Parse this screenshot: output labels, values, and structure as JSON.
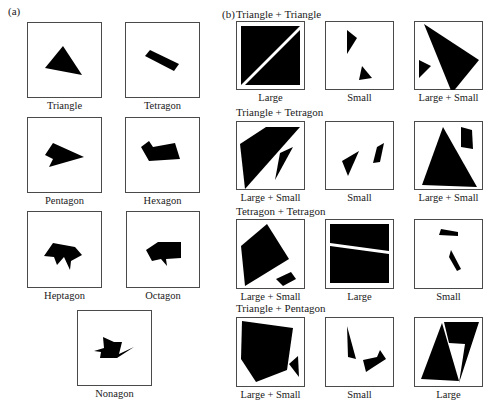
{
  "panel_a": {
    "label": "(a)",
    "items": [
      {
        "caption": "Triangle",
        "x": 27,
        "y": 22,
        "w": 75,
        "h": 76,
        "shapes": [
          [
            [
              18,
              46
            ],
            [
              36,
              24
            ],
            [
              55,
              53
            ]
          ]
        ]
      },
      {
        "caption": "Tetragon",
        "x": 125,
        "y": 22,
        "w": 75,
        "h": 76,
        "shapes": [
          [
            [
              20,
              34
            ],
            [
              25,
              28
            ],
            [
              54,
              42
            ],
            [
              49,
              49
            ]
          ]
        ]
      },
      {
        "caption": "Pentagon",
        "x": 27,
        "y": 117,
        "w": 75,
        "h": 76,
        "shapes": [
          [
            [
              18,
              38
            ],
            [
              26,
              26
            ],
            [
              57,
              40
            ],
            [
              22,
              50
            ],
            [
              26,
              42
            ]
          ]
        ]
      },
      {
        "caption": "Hexagon",
        "x": 125,
        "y": 117,
        "w": 75,
        "h": 76,
        "shapes": [
          [
            [
              16,
              30
            ],
            [
              24,
              24
            ],
            [
              28,
              30
            ],
            [
              50,
              26
            ],
            [
              55,
              42
            ],
            [
              24,
              44
            ]
          ]
        ]
      },
      {
        "caption": "Heptagon",
        "x": 27,
        "y": 211,
        "w": 75,
        "h": 77,
        "shapes": [
          [
            [
              17,
              45
            ],
            [
              26,
              32
            ],
            [
              48,
              36
            ],
            [
              55,
              44
            ],
            [
              44,
              50
            ],
            [
              43,
              59
            ],
            [
              37,
              46
            ],
            [
              30,
              54
            ],
            [
              27,
              46
            ]
          ]
        ]
      },
      {
        "caption": "Octagon",
        "x": 126,
        "y": 211,
        "w": 74,
        "h": 77,
        "shapes": [
          [
            [
              20,
              39
            ],
            [
              32,
              31
            ],
            [
              55,
              31
            ],
            [
              55,
              47
            ],
            [
              40,
              48
            ],
            [
              41,
              55
            ],
            [
              35,
              48
            ],
            [
              26,
              50
            ]
          ]
        ]
      },
      {
        "caption": "Nonagon",
        "x": 77,
        "y": 310,
        "w": 75,
        "h": 76,
        "shapes": [
          [
            [
              26,
              27
            ],
            [
              37,
              32
            ],
            [
              45,
              32
            ],
            [
              42,
              44
            ],
            [
              57,
              37
            ],
            [
              40,
              48
            ],
            [
              23,
              48
            ],
            [
              24,
              42
            ],
            [
              17,
              41
            ],
            [
              27,
              38
            ]
          ]
        ]
      }
    ]
  },
  "panel_b": {
    "label": "(b)",
    "groups": [
      {
        "title": "Triangle + Triangle",
        "title_x": 236,
        "title_y": 8,
        "items": [
          {
            "caption": "Large",
            "x": 236,
            "y": 21,
            "w": 69,
            "h": 69,
            "double": true,
            "shapes": [
              [
                [
                  5,
                  5
                ],
                [
                  64,
                  5
                ],
                [
                  5,
                  64
                ]
              ],
              [
                [
                  64,
                  9
                ],
                [
                  64,
                  64
                ],
                [
                  9,
                  64
                ]
              ]
            ]
          },
          {
            "caption": "Small",
            "x": 325,
            "y": 21,
            "w": 69,
            "h": 69,
            "shapes": [
              [
                [
                  22,
                  9
                ],
                [
                  32,
                  17
                ],
                [
                  22,
                  33
                ]
              ],
              [
                [
                  37,
                  45
                ],
                [
                  47,
                  57
                ],
                [
                  34,
                  59
                ]
              ]
            ]
          },
          {
            "caption": "Large + Small",
            "x": 414,
            "y": 21,
            "w": 69,
            "h": 69,
            "shapes": [
              [
                [
                  10,
                  3
                ],
                [
                  65,
                  39
                ],
                [
                  38,
                  72
                ]
              ],
              [
                [
                  5,
                  39
                ],
                [
                  17,
                  45
                ],
                [
                  5,
                  57
                ]
              ]
            ]
          }
        ]
      },
      {
        "title": "Triangle + Tetragon",
        "title_x": 236,
        "title_y": 106,
        "items": [
          {
            "caption": "Large + Small",
            "x": 236,
            "y": 121,
            "w": 69,
            "h": 69,
            "shapes": [
              [
                [
                  4,
                  23
                ],
                [
                  30,
                  6
                ],
                [
                  64,
                  6
                ],
                [
                  9,
                  68
                ]
              ],
              [
                [
                  44,
                  32
                ],
                [
                  57,
                  26
                ],
                [
                  39,
                  59
                ]
              ]
            ]
          },
          {
            "caption": "Small",
            "x": 325,
            "y": 121,
            "w": 69,
            "h": 69,
            "shapes": [
              [
                [
                  17,
                  40
                ],
                [
                  34,
                  30
                ],
                [
                  23,
                  55
                ]
              ],
              [
                [
                  52,
                  26
                ],
                [
                  59,
                  22
                ],
                [
                  55,
                  41
                ],
                [
                  48,
                  42
                ]
              ]
            ]
          },
          {
            "caption": "Large + Small",
            "x": 414,
            "y": 121,
            "w": 69,
            "h": 69,
            "shapes": [
              [
                [
                  8,
                  64
                ],
                [
                  29,
                  6
                ],
                [
                  63,
                  66
                ]
              ],
              [
                [
                  47,
                  6
                ],
                [
                  58,
                  9
                ],
                [
                  59,
                  28
                ],
                [
                  47,
                  26
                ]
              ]
            ]
          }
        ]
      },
      {
        "title": "Tetragon + Tetragon",
        "title_x": 236,
        "title_y": 205,
        "items": [
          {
            "caption": "Large + Small",
            "x": 236,
            "y": 219,
            "w": 69,
            "h": 70,
            "shapes": [
              [
                [
                  5,
                  27
                ],
                [
                  31,
                  5
                ],
                [
                  53,
                  40
                ],
                [
                  9,
                  67
                ]
              ],
              [
                [
                  40,
                  60
                ],
                [
                  55,
                  53
                ],
                [
                  60,
                  60
                ],
                [
                  47,
                  67
                ]
              ]
            ]
          },
          {
            "caption": "Large",
            "x": 325,
            "y": 219,
            "w": 69,
            "h": 70,
            "double": true,
            "shapes": [
              [
                [
                  5,
                  5
                ],
                [
                  64,
                  5
                ],
                [
                  64,
                  32
                ],
                [
                  5,
                  24
                ]
              ],
              [
                [
                  5,
                  27
                ],
                [
                  64,
                  35
                ],
                [
                  64,
                  64
                ],
                [
                  5,
                  64
                ]
              ]
            ]
          },
          {
            "caption": "Small",
            "x": 414,
            "y": 219,
            "w": 69,
            "h": 70,
            "shapes": [
              [
                [
                  27,
                  10
                ],
                [
                  44,
                  13
                ],
                [
                  44,
                  17
                ],
                [
                  25,
                  16
                ]
              ],
              [
                [
                  37,
                  31
                ],
                [
                  47,
                  50
                ],
                [
                  43,
                  52
                ],
                [
                  35,
                  38
                ]
              ]
            ]
          }
        ]
      },
      {
        "title": "Triangle + Pentagon",
        "title_x": 236,
        "title_y": 302,
        "items": [
          {
            "caption": "Large + Small",
            "x": 236,
            "y": 317,
            "w": 69,
            "h": 70,
            "shapes": [
              [
                [
                  6,
                  4
                ],
                [
                  57,
                  11
                ],
                [
                  51,
                  53
                ],
                [
                  20,
                  65
                ],
                [
                  5,
                  42
                ]
              ],
              [
                [
                  53,
                  47
                ],
                [
                  62,
                  39
                ],
                [
                  63,
                  60
                ]
              ]
            ]
          },
          {
            "caption": "Small",
            "x": 325,
            "y": 317,
            "w": 69,
            "h": 70,
            "shapes": [
              [
                [
                  22,
                  9
                ],
                [
                  31,
                  42
                ],
                [
                  23,
                  40
                ]
              ],
              [
                [
                  38,
                  43
                ],
                [
                  52,
                  40
                ],
                [
                  55,
                  33
                ],
                [
                  61,
                  42
                ],
                [
                  47,
                  51
                ],
                [
                  41,
                  55
                ]
              ]
            ]
          },
          {
            "caption": "Large",
            "x": 414,
            "y": 317,
            "w": 69,
            "h": 70,
            "double": true,
            "shapes": [
              [
                [
                  28,
                  6
                ],
                [
                  45,
                  64
                ],
                [
                  7,
                  62
                ]
              ],
              [
                [
                  30,
                  5
                ],
                [
                  65,
                  5
                ],
                [
                  45,
                  66
                ],
                [
                  51,
                  27
                ],
                [
                  35,
                  26
                ]
              ]
            ]
          }
        ]
      }
    ]
  },
  "colors": {
    "shape_fill": "#000000",
    "frame": "#4a4a4a",
    "background": "#ffffff"
  }
}
